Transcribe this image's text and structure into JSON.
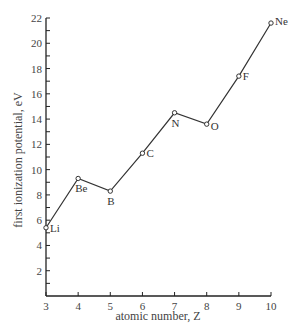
{
  "chart_data": {
    "type": "line",
    "title": "",
    "xlabel": "atomic number, Z",
    "ylabel": "first ionization potential, eV",
    "xlim": [
      3,
      10
    ],
    "ylim": [
      0,
      22
    ],
    "x_ticks": [
      3,
      4,
      5,
      6,
      7,
      8,
      9,
      10
    ],
    "y_ticks": [
      2,
      4,
      6,
      8,
      10,
      12,
      14,
      16,
      18,
      20,
      22
    ],
    "y_minor_step": 1,
    "grid": false,
    "legend": null,
    "series": [
      {
        "name": "first ionization potential",
        "x": [
          3,
          4,
          5,
          6,
          7,
          8,
          9,
          10
        ],
        "values": [
          5.4,
          9.3,
          8.3,
          11.3,
          14.5,
          13.6,
          17.4,
          21.6
        ],
        "labels": [
          "Li",
          "Be",
          "B",
          "C",
          "N",
          "O",
          "F",
          "Ne"
        ]
      }
    ]
  },
  "colors": {
    "line": "#333333",
    "axis": "#222222",
    "text": "#444444"
  }
}
